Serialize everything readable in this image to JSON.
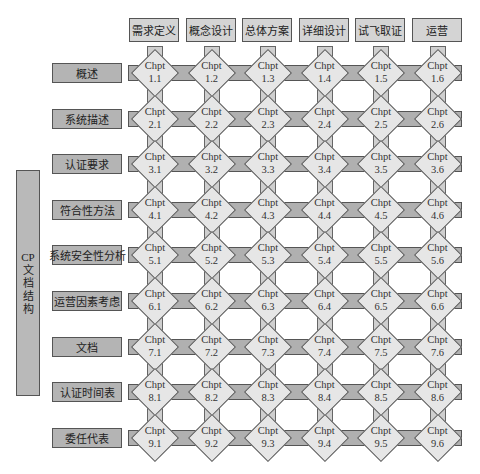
{
  "headers": [
    "需求定义",
    "概念设计",
    "总体方案",
    "详细设计",
    "试飞取证",
    "运营"
  ],
  "side_label": {
    "line1": "CP",
    "line2": "文",
    "line3": "档",
    "line4": "结",
    "line5": "构"
  },
  "rows": [
    "概述",
    "系统描述",
    "认证要求",
    "符合性方法",
    "系统安全性分析",
    "运营因素考虑",
    "文档",
    "认证时间表",
    "委任代表"
  ],
  "cell_prefix": "Chpt",
  "cells": [
    [
      "1.1",
      "1.2",
      "1.3",
      "1.4",
      "1.5",
      "1.6"
    ],
    [
      "2.1",
      "2.2",
      "2.3",
      "2.4",
      "2.5",
      "2.6"
    ],
    [
      "3.1",
      "3.2",
      "3.3",
      "3.4",
      "3.5",
      "3.6"
    ],
    [
      "4.1",
      "4.2",
      "4.3",
      "4.4",
      "4.5",
      "4.6"
    ],
    [
      "5.1",
      "5.2",
      "5.3",
      "5.4",
      "5.5",
      "5.6"
    ],
    [
      "6.1",
      "6.2",
      "6.3",
      "6.4",
      "6.5",
      "6.6"
    ],
    [
      "7.1",
      "7.2",
      "7.3",
      "7.4",
      "7.5",
      "7.6"
    ],
    [
      "8.1",
      "8.2",
      "8.3",
      "8.4",
      "8.5",
      "8.6"
    ],
    [
      "9.1",
      "9.2",
      "9.3",
      "9.4",
      "9.5",
      "9.6"
    ]
  ],
  "colors": {
    "bar": "#b0b0b0",
    "diamond": "#e6e6e6",
    "header": "#d4d4d4",
    "border": "#555555"
  }
}
